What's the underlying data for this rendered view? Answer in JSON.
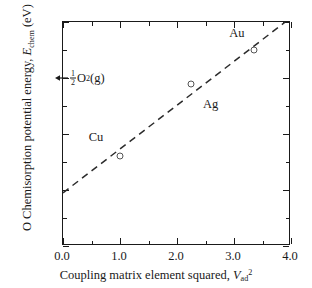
{
  "chart_data": {
    "type": "scatter",
    "title": "",
    "xlabel": "Coupling matrix element squared, V ad 2",
    "ylabel": "O Chemisorption potential energy, E chem  (eV)",
    "xlim": [
      0.0,
      4.0
    ],
    "ylim": [
      -6.0,
      -2.0
    ],
    "grid": false,
    "legend": "none",
    "x_major_ticks": [
      "0.0",
      "1.0",
      "2.0",
      "3.0",
      "4.0"
    ],
    "x_major_values": [
      0.0,
      1.0,
      2.0,
      3.0,
      4.0
    ],
    "x_minor_values": [
      0.5,
      1.5,
      2.5,
      3.5
    ],
    "y_major_ticks": [
      "-2.0",
      "-3.0",
      "-4.0",
      "-5.0",
      "-6.0"
    ],
    "y_major_values": [
      -2.0,
      -3.0,
      -4.0,
      -5.0,
      -6.0
    ],
    "y_minor_values": [
      -2.5,
      -3.5,
      -4.5,
      -5.5
    ],
    "points": [
      {
        "label": "Cu",
        "x": 1.0,
        "y": -4.4,
        "label_dx": -0.42,
        "label_dy": 0.34
      },
      {
        "label": "Ag",
        "x": 2.25,
        "y": -3.1,
        "label_dx": 0.34,
        "label_dy": -0.36
      },
      {
        "label": "Au",
        "x": 3.35,
        "y": -2.5,
        "label_dx": -0.3,
        "label_dy": 0.3
      }
    ],
    "trendline": {
      "style": "dashed",
      "x_start": 0.0,
      "y_start": -5.05,
      "x_end": 3.9,
      "y_end": -2.0
    },
    "annotations": [
      {
        "name": "half-o2-gas",
        "text_fraction_numerator": "1",
        "text_fraction_denominator": "2",
        "text_main": "O",
        "text_subscript": "2",
        "text_suffix": "(g)",
        "arrow": "left-arrow",
        "y": -3.0,
        "x_text": 0.12
      }
    ]
  },
  "axis": {
    "y_title_part1": "O Chemisorption potential energy, ",
    "y_title_symbol": "E",
    "y_title_subscript": "chem",
    "y_title_part2": " (eV)",
    "x_title_part1": "Coupling matrix element squared, ",
    "x_title_symbol": "V",
    "x_title_subscript": "ad",
    "x_title_superscript": "2"
  },
  "colors": {
    "axis": "#1a1a1a",
    "marker": "#555555",
    "trendline": "#2b2b2b",
    "background": "#ffffff"
  }
}
